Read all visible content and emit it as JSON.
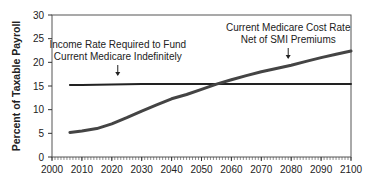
{
  "chart_data": {
    "type": "line",
    "title": "",
    "xlabel": "",
    "ylabel": "Percent of Taxable Payroll",
    "xlim": [
      2000,
      2100
    ],
    "ylim": [
      0,
      30
    ],
    "x_ticks": [
      2000,
      2010,
      2020,
      2030,
      2040,
      2050,
      2060,
      2070,
      2080,
      2090,
      2100
    ],
    "y_ticks": [
      0,
      5,
      10,
      15,
      20,
      25,
      30
    ],
    "grid": false,
    "legend": null,
    "series": [
      {
        "name": "Income Rate Required to Fund Current Medicare Indefinitely",
        "color": "#222222",
        "x": [
          2006,
          2010,
          2020,
          2030,
          2040,
          2050,
          2060,
          2070,
          2080,
          2090,
          2100
        ],
        "values": [
          15.2,
          15.2,
          15.3,
          15.4,
          15.4,
          15.4,
          15.4,
          15.4,
          15.4,
          15.4,
          15.4
        ]
      },
      {
        "name": "Current Medicare Cost Rate Net of SMI Premiums",
        "color": "#444444",
        "x": [
          2006,
          2010,
          2015,
          2020,
          2025,
          2030,
          2035,
          2040,
          2045,
          2050,
          2055,
          2060,
          2065,
          2070,
          2075,
          2080,
          2085,
          2090,
          2095,
          2100
        ],
        "values": [
          5.2,
          5.5,
          6.0,
          7.0,
          8.3,
          9.7,
          11.0,
          12.3,
          13.2,
          14.3,
          15.4,
          16.3,
          17.2,
          18.0,
          18.7,
          19.4,
          20.2,
          21.0,
          21.7,
          22.4
        ]
      }
    ],
    "annotations": [
      {
        "text_lines": [
          "Income Rate Required to Fund",
          "Current Medicare Indefinitely"
        ],
        "arrow_x": 2022,
        "arrow_to_y": 15.4
      },
      {
        "text_lines": [
          "Current Medicare Cost Rate",
          "Net of SMI Premiums"
        ],
        "arrow_x": 2079,
        "arrow_to_y": 19.3
      }
    ]
  }
}
